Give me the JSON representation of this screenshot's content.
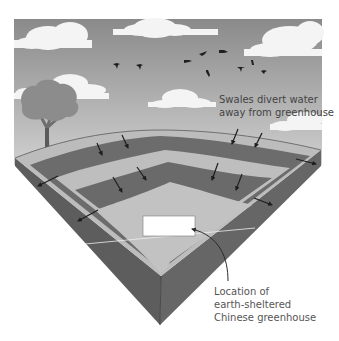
{
  "diagram": {
    "annotations": {
      "swales": {
        "line1": "Swales divert water",
        "line2": "away from greenhouse"
      },
      "greenhouse": {
        "line1": "Location of",
        "line2": "earth-sheltered",
        "line3": "Chinese greenhouse"
      }
    },
    "elements": [
      "sky",
      "clouds",
      "birds",
      "tree",
      "terraced-ground-block",
      "swale-channels",
      "flow-arrows",
      "greenhouse-site"
    ],
    "colors": {
      "sky_top": "#8a8a8a",
      "sky_bottom": "#c8c8c8",
      "cloud": "#f5f5f5",
      "ground_surface": "#bdbdbd",
      "swale_channel": "#6b6b6b",
      "block_side": "#5e5e5e",
      "tree": "#8c8c8c",
      "bird": "#222222",
      "greenhouse": "#ffffff"
    }
  }
}
